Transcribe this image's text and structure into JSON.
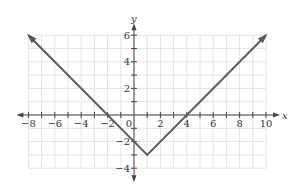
{
  "chart_data": {
    "type": "line",
    "title": "",
    "function": "y = |x - 1| - 3",
    "xlabel": "x",
    "ylabel": "y",
    "xlim": [
      -8,
      10
    ],
    "ylim": [
      -4,
      6
    ],
    "grid": true,
    "x_ticks": [
      -8,
      -6,
      -4,
      -2,
      0,
      2,
      4,
      6,
      8,
      10
    ],
    "y_ticks": [
      -4,
      -2,
      2,
      4,
      6
    ],
    "x_tick_labels": [
      "−8",
      "−6",
      "−4",
      "−2",
      "0",
      "2",
      "4",
      "6",
      "8",
      "10"
    ],
    "y_tick_labels": [
      "−4",
      "−2",
      "2",
      "4",
      "6"
    ],
    "series": [
      {
        "name": "absolute value",
        "points": [
          [
            -8,
            6
          ],
          [
            1,
            -3
          ],
          [
            10,
            6
          ]
        ],
        "arrows": "both ends",
        "color": "#555555"
      }
    ],
    "key_points": {
      "vertex": [
        1,
        -3
      ],
      "x_intercepts": [
        -2,
        4
      ],
      "y_intercept": [
        0,
        -2
      ]
    }
  },
  "colors": {
    "grid": "#e4e4e4",
    "axis": "#444444",
    "curve": "#5a5a5a"
  }
}
